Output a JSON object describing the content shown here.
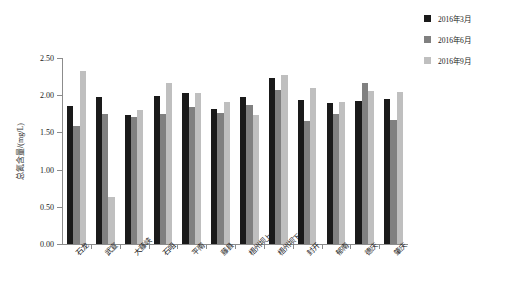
{
  "chart_data": {
    "type": "bar",
    "title": "",
    "xlabel": "",
    "ylabel": "总氮含量/(mg/L)",
    "ylim": [
      0.0,
      2.5
    ],
    "ytick_labels": [
      "0.00",
      "0.50",
      "1.00",
      "1.50",
      "2.00",
      "2.50"
    ],
    "ytick_values": [
      0.0,
      0.5,
      1.0,
      1.5,
      2.0,
      2.5
    ],
    "grid": false,
    "legend_position": "top-right",
    "categories": [
      "石龙",
      "武宣",
      "大藤峡",
      "石咀",
      "平南",
      "藤县",
      "梧州坝上",
      "梧州坝下",
      "封开",
      "郁南",
      "德庆",
      "肇庆"
    ],
    "series": [
      {
        "name": "2016年3月",
        "color": "#1a1a1a",
        "values": [
          1.86,
          1.98,
          1.74,
          1.99,
          2.03,
          1.82,
          1.98,
          2.23,
          1.93,
          1.89,
          1.92,
          1.95
        ]
      },
      {
        "name": "2016年6月",
        "color": "#808080",
        "values": [
          1.58,
          1.75,
          1.71,
          1.75,
          1.84,
          1.76,
          1.87,
          2.07,
          1.65,
          1.75,
          2.16,
          1.67
        ]
      },
      {
        "name": "2016年9月",
        "color": "#bfbfbf",
        "values": [
          2.33,
          0.63,
          1.8,
          2.17,
          2.03,
          1.91,
          1.73,
          2.27,
          2.1,
          1.91,
          2.06,
          2.04
        ]
      }
    ]
  },
  "legend": {
    "items": [
      {
        "label": "2016年3月",
        "color": "#1a1a1a"
      },
      {
        "label": "2016年6月",
        "color": "#808080"
      },
      {
        "label": "2016年9月",
        "color": "#bfbfbf"
      }
    ]
  },
  "axes": {
    "y_title": "总氮含量/(mg/L)"
  }
}
